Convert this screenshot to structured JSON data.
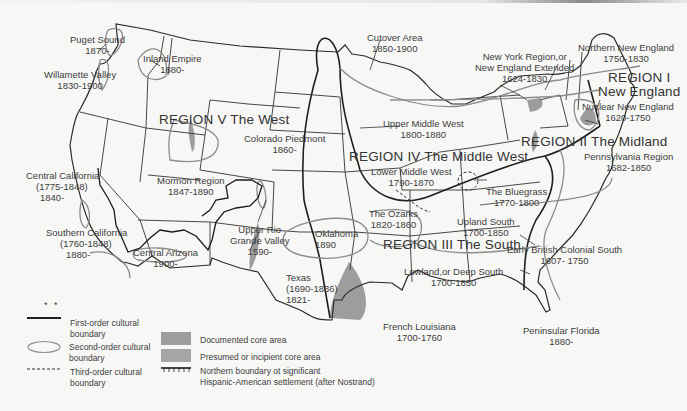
{
  "map": {
    "type": "cultural regions map",
    "subject": "Culture regions of the United States",
    "colors": {
      "background": "#f7f7f5",
      "first_order_boundary": "#222222",
      "second_order_boundary": "#8c8c8c",
      "core_area_fill": "#9a9a9a",
      "text": "#3a3a3a"
    },
    "regions": [
      {
        "id": "I",
        "label": "REGION I",
        "sublabel": "New England"
      },
      {
        "id": "II",
        "label": "REGION II The Midland"
      },
      {
        "id": "III",
        "label": "REGION III The South"
      },
      {
        "id": "IV",
        "label": "REGION IV The Middle West"
      },
      {
        "id": "V",
        "label": "REGION V The West"
      }
    ],
    "subregions": [
      {
        "name": "Puget Sound",
        "dates": "1870-"
      },
      {
        "name": "Willamette Valley",
        "dates": "1830-1900"
      },
      {
        "name": "Inland Empire",
        "dates": "1880-"
      },
      {
        "name": "Cutover Area",
        "dates": "1850-1900"
      },
      {
        "name": "Northern New England",
        "dates": "1750-1830"
      },
      {
        "name": "New York Region,or",
        "name2": "New England Extended",
        "dates": "1624-1830"
      },
      {
        "name": "Nuclear New England",
        "dates": "1620-1750"
      },
      {
        "name": "Upper Middle West",
        "dates": "1800-1880"
      },
      {
        "name": "Colorado Piedmont",
        "dates": "1860-"
      },
      {
        "name": "Lower Middle West",
        "dates": "1790-1870"
      },
      {
        "name": "Pennsylvania Region",
        "dates": "1682-1850"
      },
      {
        "name": "Central California",
        "dates": "(1775-1848)",
        "dates2": "1840-"
      },
      {
        "name": "Mormon Region",
        "dates": "1847-1890"
      },
      {
        "name": "The Bluegrass",
        "dates": "1770-1800"
      },
      {
        "name": "The Ozarks",
        "dates": "1820-1860"
      },
      {
        "name": "Upland South",
        "dates": "1700-1850"
      },
      {
        "name": "Southern California",
        "dates": "(1760-1848)",
        "dates2": "1880-"
      },
      {
        "name": "Central Arizona",
        "dates": "1900-"
      },
      {
        "name": "Upper Rio",
        "name2": "Grande Valley",
        "dates": "1590-"
      },
      {
        "name": "Oklahoma",
        "dates": "1890"
      },
      {
        "name": "Early British Colonial South",
        "dates": "1607- 1750"
      },
      {
        "name": "Texas",
        "dates": "(1690-1836)",
        "dates2": "1821-"
      },
      {
        "name": "Lowland,or Deep South",
        "dates": "1700-1850"
      },
      {
        "name": "French Louisiana",
        "dates": "1700-1760"
      },
      {
        "name": "Peninsular Florida",
        "dates": "1880-"
      }
    ]
  },
  "legend": {
    "asterisks": "* *",
    "items": [
      {
        "symbol": "solid-line",
        "label": "First-order cultural",
        "label2": "boundary"
      },
      {
        "symbol": "ellipse",
        "label": "Second-order cultural",
        "label2": "boundary"
      },
      {
        "symbol": "dashed-line",
        "label": "Third-order cultural",
        "label2": "boundary"
      },
      {
        "symbol": "gray-box",
        "label": "Documented core area"
      },
      {
        "symbol": "gray-box",
        "label": "Presumed or incipient core area"
      },
      {
        "symbol": "hatched-line",
        "label": "Northern boundary ot significant",
        "label2": "Hispanic-American settlement (after Nostrand)"
      }
    ]
  }
}
